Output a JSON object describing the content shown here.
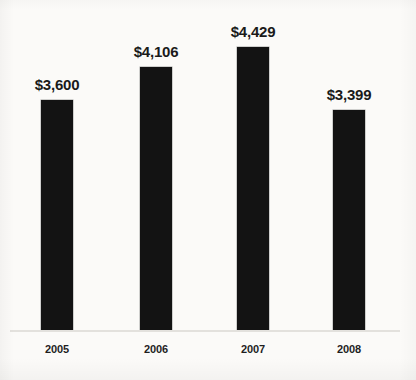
{
  "chart_data": {
    "type": "bar",
    "title": "",
    "subtitle": "",
    "xlabel": "",
    "ylabel": "",
    "categories": [
      "2005",
      "2006",
      "2007",
      "2008"
    ],
    "values": [
      3600,
      4106,
      4429,
      3399
    ],
    "value_labels": [
      "$3,600",
      "$4,106",
      "$4,429",
      "$3,399"
    ],
    "series": [
      {
        "name": "",
        "values": [
          3600,
          4106,
          4429,
          3399
        ]
      }
    ],
    "ylim": [
      0,
      4429
    ],
    "grid": false,
    "legend": false,
    "legend_position": "none",
    "axis_visible": true,
    "bar_color": "#131313",
    "label_color": "#1a1a1a",
    "background_color": "#fbfaf8",
    "baseline_color": "#e3e1dd",
    "bars": [
      {
        "category": "2005",
        "value": 3600,
        "label": "$3,600",
        "left": 41,
        "width": 32,
        "top": 100,
        "height": 231
      },
      {
        "category": "2006",
        "value": 4106,
        "label": "$4,106",
        "left": 140,
        "width": 32,
        "top": 67,
        "height": 264
      },
      {
        "category": "2007",
        "value": 4429,
        "label": "$4,429",
        "left": 237,
        "width": 32,
        "top": 47,
        "height": 284
      },
      {
        "category": "2008",
        "value": 3399,
        "label": "$3,399",
        "left": 333,
        "width": 32,
        "top": 110,
        "height": 221
      }
    ]
  }
}
